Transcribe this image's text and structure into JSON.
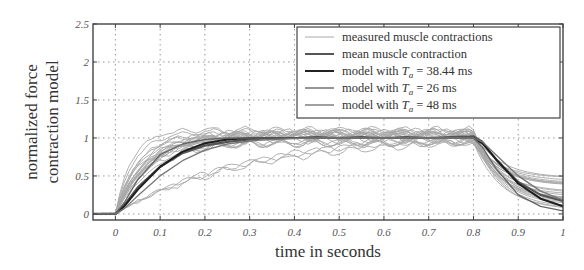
{
  "chart_data": {
    "type": "line",
    "title": "",
    "xlabel": "time in seconds",
    "ylabel_lines": [
      "normalized force",
      "contraction model"
    ],
    "xlim": [
      -0.05,
      1.0
    ],
    "ylim": [
      -0.08,
      2.5
    ],
    "xticks": [
      0,
      0.1,
      0.2,
      0.3,
      0.4,
      0.5,
      0.6,
      0.7,
      0.8,
      0.9,
      1
    ],
    "xtick_labels": [
      "0",
      "0.1",
      "0.2",
      "0.3",
      "0.4",
      "0.5",
      "0.6",
      "0.7",
      "0.8",
      "0.9",
      "1"
    ],
    "yticks": [
      0,
      0.5,
      1,
      1.5,
      2,
      2.5
    ],
    "ytick_labels": [
      "0",
      "0.5",
      "1",
      "1.5",
      "2",
      "2.5"
    ],
    "grid": true,
    "legend_position": "upper right",
    "legend": [
      {
        "label": "measured muscle contractions",
        "color": "#aaaaaa",
        "width": 1
      },
      {
        "label": "mean muscle contraction",
        "color": "#555555",
        "width": 2
      },
      {
        "label_prefix": "model with ",
        "label_var": "T",
        "label_sub": "a",
        "label_suffix": " = 38.44 ms",
        "color": "#222222",
        "width": 2
      },
      {
        "label_prefix": "model with ",
        "label_var": "T",
        "label_sub": "a",
        "label_suffix": " = 26 ms",
        "color": "#666666",
        "width": 1.4
      },
      {
        "label_prefix": "model with ",
        "label_var": "T",
        "label_sub": "a",
        "label_suffix": " = 48 ms",
        "color": "#777777",
        "width": 1.4
      }
    ],
    "series": [
      {
        "name": "mean muscle contraction",
        "x": [
          -0.05,
          0,
          0.02,
          0.05,
          0.1,
          0.15,
          0.2,
          0.25,
          0.3,
          0.35,
          0.4,
          0.45,
          0.5,
          0.55,
          0.6,
          0.65,
          0.7,
          0.75,
          0.8,
          0.82,
          0.85,
          0.9,
          0.95,
          1.0
        ],
        "y": [
          0,
          0,
          0.12,
          0.35,
          0.62,
          0.8,
          0.9,
          0.95,
          0.98,
          1.0,
          1.0,
          1.01,
          1.0,
          1.01,
          1.0,
          1.01,
          1.0,
          1.01,
          1.02,
          0.95,
          0.72,
          0.42,
          0.25,
          0.17
        ]
      },
      {
        "name": "model with Ta = 38.44 ms",
        "x": [
          -0.05,
          0,
          0.02,
          0.05,
          0.1,
          0.15,
          0.2,
          0.25,
          0.3,
          0.35,
          0.4,
          0.45,
          0.5,
          0.55,
          0.6,
          0.65,
          0.7,
          0.75,
          0.8,
          0.82,
          0.85,
          0.9,
          0.95,
          1.0
        ],
        "y": [
          0,
          0,
          0.1,
          0.32,
          0.62,
          0.82,
          0.93,
          0.98,
          1.0,
          1.0,
          1.0,
          1.0,
          1.0,
          1.0,
          1.0,
          1.0,
          1.0,
          1.0,
          1.0,
          0.93,
          0.72,
          0.4,
          0.2,
          0.1
        ]
      },
      {
        "name": "model with Ta = 26 ms",
        "x": [
          -0.05,
          0,
          0.02,
          0.05,
          0.1,
          0.15,
          0.2,
          0.25,
          0.3,
          0.35,
          0.4,
          0.45,
          0.5,
          0.55,
          0.6,
          0.65,
          0.7,
          0.75,
          0.8,
          0.82,
          0.85,
          0.9,
          0.95,
          1.0
        ],
        "y": [
          0,
          0,
          0.15,
          0.45,
          0.78,
          0.92,
          0.98,
          1.0,
          1.0,
          1.0,
          1.0,
          1.0,
          1.0,
          1.0,
          1.0,
          1.0,
          1.0,
          1.0,
          1.0,
          0.88,
          0.6,
          0.25,
          0.1,
          0.04
        ]
      },
      {
        "name": "model with Ta = 48 ms",
        "x": [
          -0.05,
          0,
          0.02,
          0.05,
          0.1,
          0.15,
          0.2,
          0.25,
          0.3,
          0.35,
          0.4,
          0.45,
          0.5,
          0.55,
          0.6,
          0.65,
          0.7,
          0.75,
          0.8,
          0.82,
          0.85,
          0.9,
          0.95,
          1.0
        ],
        "y": [
          0,
          0,
          0.07,
          0.24,
          0.5,
          0.7,
          0.84,
          0.92,
          0.96,
          0.98,
          0.99,
          1.0,
          1.0,
          1.0,
          1.0,
          1.0,
          1.0,
          1.0,
          1.0,
          0.95,
          0.78,
          0.5,
          0.3,
          0.18
        ]
      }
    ],
    "measured_curves_note": "approx. 20 light-gray measured contraction traces rising from 0 at t=0 to ~1.0 plateau (range ~0.9–1.15), with a few slow outliers reaching 1.0 only near t=0.5–0.8, decaying after t=0.8 to ~0.05–0.5 at t=1"
  }
}
